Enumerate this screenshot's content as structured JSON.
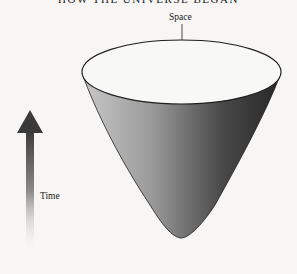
{
  "title": "HOW THE UNIVERSE BEGAN",
  "labels": {
    "space": "Space",
    "time": "Time"
  },
  "colors": {
    "background": "#f7f6f4",
    "cone_light": "#c4c4c4",
    "cone_dark": "#2a2a2a",
    "arrow_dark": "#3a3a3a",
    "outline": "#1e1e1e"
  },
  "diagram": {
    "type": "cone-of-spacetime"
  }
}
